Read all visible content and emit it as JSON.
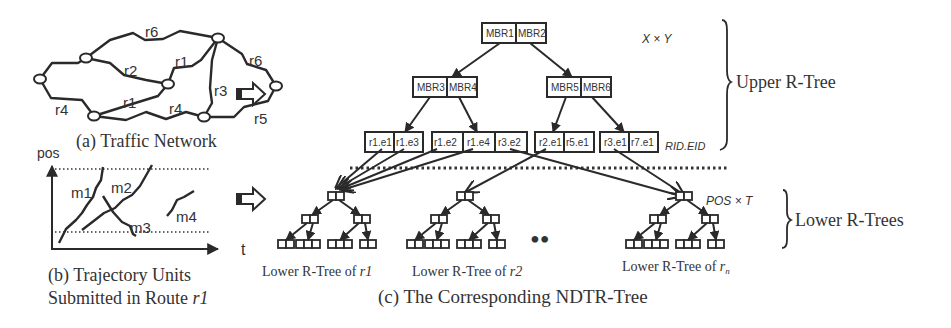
{
  "figure": {
    "panel_a": {
      "caption": "(a) Traffic Network",
      "road_labels": [
        "r6",
        "r2",
        "r1",
        "r6",
        "r3",
        "r1",
        "r4",
        "r4",
        "r5"
      ]
    },
    "panel_b": {
      "caption_line1": "(b) Trajectory Units",
      "caption_line2_prefix": "Submitted in Route ",
      "caption_line2_route": "r1",
      "y_axis_label": "pos",
      "x_axis_label": "t",
      "unit_labels": [
        "m1",
        "m2",
        "m3",
        "m4"
      ]
    },
    "panel_c": {
      "caption": "(c) The Corresponding NDTR-Tree",
      "upper": {
        "root": [
          "MBR1",
          "MBR2"
        ],
        "level2_left": [
          "MBR3",
          "MBR4"
        ],
        "level2_right": [
          "MBR5",
          "MBR6"
        ],
        "leaves": [
          [
            "r1.e1",
            "r1.e3"
          ],
          [
            "r1.e2",
            "r1.e4",
            "r3.e2"
          ],
          [
            "r2.e1",
            "r5.e1"
          ],
          [
            "r3.e1",
            "r7.e1"
          ]
        ],
        "space_label": "X × Y",
        "leaf_key_label": "RID.EID",
        "brace_label": "Upper R-Tree"
      },
      "lower": {
        "tree_labels": [
          "Lower R-Tree of ",
          "Lower R-Tree of ",
          "Lower R-Tree of "
        ],
        "tree_routes": [
          "r1",
          "r2",
          "r"
        ],
        "tree_route_sub": [
          "",
          "",
          "n"
        ],
        "ellipsis": "••",
        "space_label": "POS × T",
        "brace_label": "Lower R-Trees"
      }
    }
  }
}
